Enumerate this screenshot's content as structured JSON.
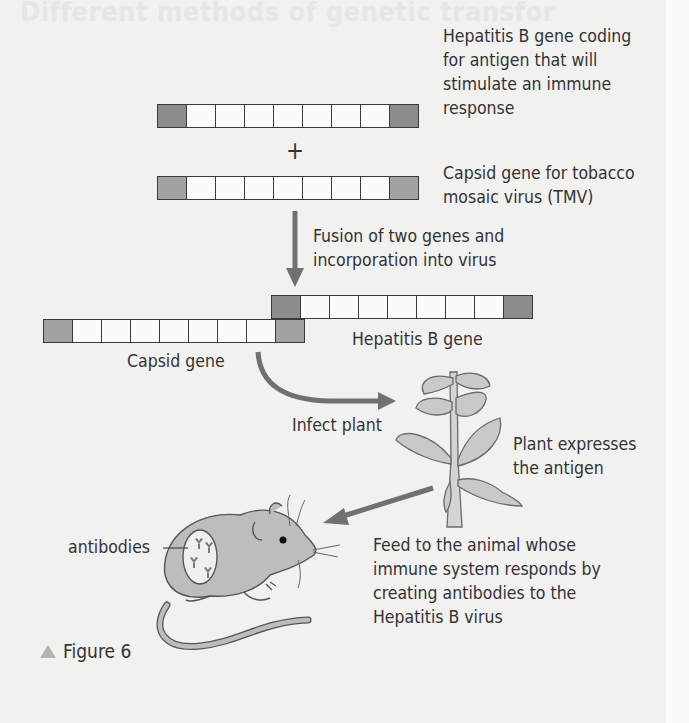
{
  "figure": {
    "caption": "Figure 6",
    "background_color": "#f1f1f0",
    "gene_end_color": "#8c8c8c",
    "arrow_color": "#707070"
  },
  "ghost_text": "Different methods of genetic transfor",
  "genes": {
    "hep_b_top": {
      "cells": 9,
      "label": "Hepatitis B gene coding\nfor antigen that will\nstimulate an immune\nresponse"
    },
    "plus": "+",
    "capsid_top": {
      "cells": 9,
      "label": "Capsid gene for tobacco\nmosaic virus (TMV)"
    },
    "fusion_label": "Fusion of two genes and\nincorporation into virus",
    "fused_hep_b": {
      "cells": 9,
      "label": "Hepatitis B gene"
    },
    "fused_capsid": {
      "cells": 9,
      "label": "Capsid gene"
    }
  },
  "steps": {
    "infect": "Infect plant",
    "plant_expresses": "Plant expresses\nthe antigen",
    "feed": "Feed to the animal whose\nimmune system responds by\ncreating antibodies to the\nHepatitis B virus",
    "antibodies": "antibodies"
  }
}
